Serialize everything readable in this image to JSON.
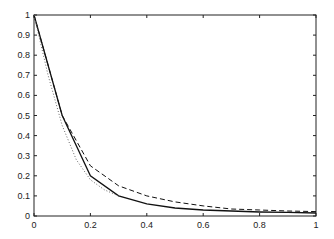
{
  "chart_data": {
    "type": "line",
    "title": "",
    "xlabel": "",
    "ylabel": "",
    "xlim": [
      0,
      1
    ],
    "ylim": [
      0,
      1
    ],
    "grid": false,
    "legend": null,
    "x_ticks": [
      "0",
      "0.2",
      "0.4",
      "0.6",
      "0.8",
      "1"
    ],
    "y_ticks": [
      "0",
      "0.1",
      "0.2",
      "0.3",
      "0.4",
      "0.5",
      "0.6",
      "0.7",
      "0.8",
      "0.9",
      "1"
    ],
    "series": [
      {
        "name": "solid",
        "style": "solid",
        "x": [
          0,
          0.1,
          0.2,
          0.3,
          0.4,
          0.5,
          0.6,
          0.7,
          0.8,
          0.9,
          1.0
        ],
        "y": [
          1.0,
          0.5,
          0.2,
          0.1,
          0.06,
          0.04,
          0.03,
          0.025,
          0.02,
          0.018,
          0.015
        ]
      },
      {
        "name": "dashed",
        "style": "dashed",
        "x": [
          0,
          0.1,
          0.2,
          0.3,
          0.4,
          0.5,
          0.6,
          0.7,
          0.8,
          0.9,
          1.0
        ],
        "y": [
          1.0,
          0.5,
          0.25,
          0.15,
          0.1,
          0.07,
          0.05,
          0.035,
          0.03,
          0.025,
          0.022
        ]
      },
      {
        "name": "dotted",
        "style": "dotted",
        "x": [
          0,
          0.05,
          0.1,
          0.15,
          0.2,
          0.25,
          0.3
        ],
        "y": [
          1.0,
          0.7,
          0.45,
          0.28,
          0.18,
          0.13,
          0.1
        ]
      }
    ]
  }
}
